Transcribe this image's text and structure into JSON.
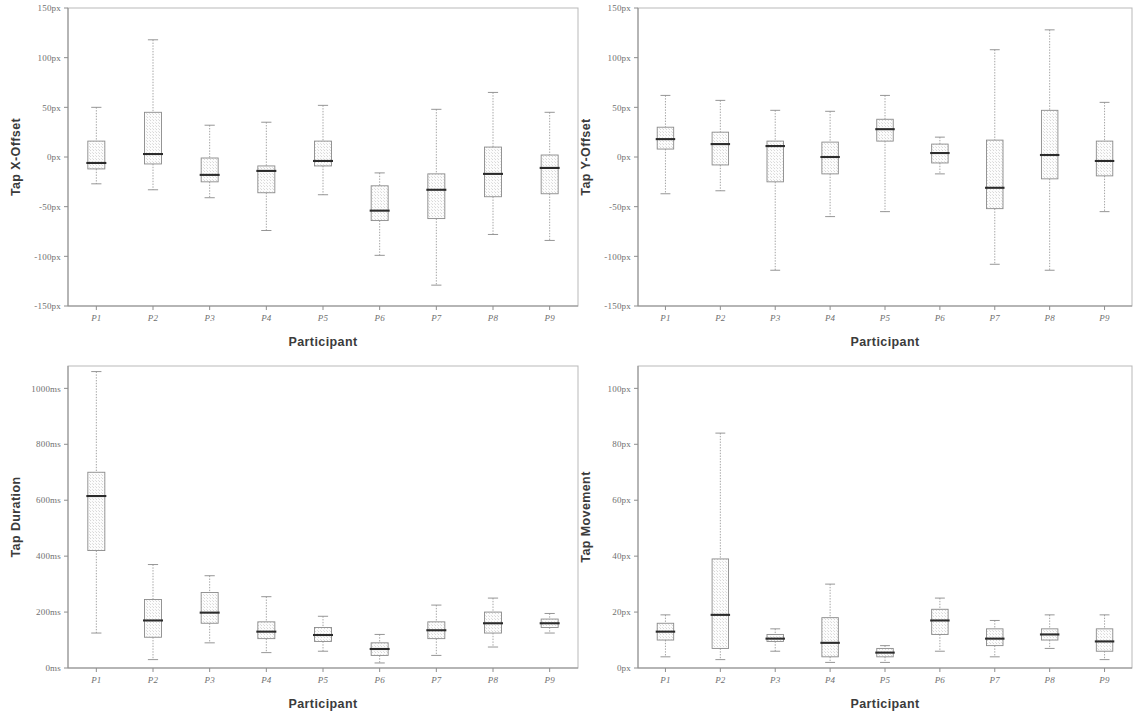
{
  "figure": {
    "participants": [
      "P1",
      "P2",
      "P3",
      "P4",
      "P5",
      "P6",
      "P7",
      "P8",
      "P9"
    ],
    "x_axis_title": "Participant",
    "colors": {
      "frame": "#b9b9b9",
      "axis": "#8e8e8e",
      "box_stroke": "#8a8a8a",
      "box_fill": "#fbfbfb",
      "median": "#2b2b2b",
      "whisker": "#9a9a9a",
      "tick_label": "#6f6f6f",
      "axis_title": "#3b3b3b"
    }
  },
  "chart_data": [
    {
      "id": "tap-x-offset",
      "position": "top-left",
      "type": "box",
      "title": "",
      "xlabel": "Participant",
      "ylabel": "Tap X-Offset",
      "ylim": [
        -150,
        150
      ],
      "unit": "px",
      "yticks": [
        150,
        100,
        50,
        0,
        -50,
        -100,
        -150
      ],
      "ytick_labels": [
        "150px",
        "100px",
        "50px",
        "0px",
        "-50px",
        "-100px",
        "-150px"
      ],
      "grid": false,
      "legend": "none",
      "categories": [
        "P1",
        "P2",
        "P3",
        "P4",
        "P5",
        "P6",
        "P7",
        "P8",
        "P9"
      ],
      "boxes": [
        {
          "category": "P1",
          "min": -27,
          "q1": -12,
          "median": -6,
          "q3": 16,
          "max": 50
        },
        {
          "category": "P2",
          "min": -33,
          "q1": -7,
          "median": 3,
          "q3": 45,
          "max": 118
        },
        {
          "category": "P3",
          "min": -41,
          "q1": -25,
          "median": -18,
          "q3": -1,
          "max": 32
        },
        {
          "category": "P4",
          "min": -74,
          "q1": -36,
          "median": -14,
          "q3": -9,
          "max": 35
        },
        {
          "category": "P5",
          "min": -38,
          "q1": -9,
          "median": -4,
          "q3": 16,
          "max": 52
        },
        {
          "category": "P6",
          "min": -99,
          "q1": -64,
          "median": -54,
          "q3": -29,
          "max": -16
        },
        {
          "category": "P7",
          "min": -129,
          "q1": -62,
          "median": -33,
          "q3": -17,
          "max": 48
        },
        {
          "category": "P8",
          "min": -78,
          "q1": -40,
          "median": -17,
          "q3": 10,
          "max": 65
        },
        {
          "category": "P9",
          "min": -84,
          "q1": -37,
          "median": -11,
          "q3": 2,
          "max": 45
        }
      ]
    },
    {
      "id": "tap-y-offset",
      "position": "top-right",
      "type": "box",
      "title": "",
      "xlabel": "Participant",
      "ylabel": "Tap Y-Offset",
      "ylim": [
        -150,
        150
      ],
      "unit": "px",
      "yticks": [
        150,
        100,
        50,
        0,
        -50,
        -100,
        -150
      ],
      "ytick_labels": [
        "150px",
        "100px",
        "50px",
        "0px",
        "-50px",
        "-100px",
        "-150px"
      ],
      "grid": false,
      "legend": "none",
      "categories": [
        "P1",
        "P2",
        "P3",
        "P4",
        "P5",
        "P6",
        "P7",
        "P8",
        "P9"
      ],
      "boxes": [
        {
          "category": "P1",
          "min": -37,
          "q1": 8,
          "median": 18,
          "q3": 30,
          "max": 62
        },
        {
          "category": "P2",
          "min": -34,
          "q1": -8,
          "median": 13,
          "q3": 25,
          "max": 57
        },
        {
          "category": "P3",
          "min": -114,
          "q1": -25,
          "median": 11,
          "q3": 16,
          "max": 47
        },
        {
          "category": "P4",
          "min": -60,
          "q1": -17,
          "median": 0,
          "q3": 15,
          "max": 46
        },
        {
          "category": "P5",
          "min": -55,
          "q1": 16,
          "median": 28,
          "q3": 38,
          "max": 62
        },
        {
          "category": "P6",
          "min": -17,
          "q1": -6,
          "median": 4,
          "q3": 13,
          "max": 20
        },
        {
          "category": "P7",
          "min": -108,
          "q1": -52,
          "median": -31,
          "q3": 17,
          "max": 108
        },
        {
          "category": "P8",
          "min": -114,
          "q1": -22,
          "median": 2,
          "q3": 47,
          "max": 128
        },
        {
          "category": "P9",
          "min": -55,
          "q1": -19,
          "median": -4,
          "q3": 16,
          "max": 55
        }
      ]
    },
    {
      "id": "tap-duration",
      "position": "bottom-left",
      "type": "box",
      "title": "",
      "xlabel": "Participant",
      "ylabel": "Tap Duration",
      "ylim": [
        0,
        1080
      ],
      "unit": "ms",
      "yticks": [
        1000,
        800,
        600,
        400,
        200,
        0
      ],
      "ytick_labels": [
        "1000ms",
        "800ms",
        "600ms",
        "400ms",
        "200ms",
        "0ms"
      ],
      "grid": false,
      "legend": "none",
      "categories": [
        "P1",
        "P2",
        "P3",
        "P4",
        "P5",
        "P6",
        "P7",
        "P8",
        "P9"
      ],
      "boxes": [
        {
          "category": "P1",
          "min": 125,
          "q1": 420,
          "median": 615,
          "q3": 700,
          "max": 1060
        },
        {
          "category": "P2",
          "min": 30,
          "q1": 110,
          "median": 170,
          "q3": 245,
          "max": 370
        },
        {
          "category": "P3",
          "min": 90,
          "q1": 160,
          "median": 198,
          "q3": 270,
          "max": 330
        },
        {
          "category": "P4",
          "min": 55,
          "q1": 105,
          "median": 130,
          "q3": 165,
          "max": 255
        },
        {
          "category": "P5",
          "min": 60,
          "q1": 95,
          "median": 118,
          "q3": 145,
          "max": 185
        },
        {
          "category": "P6",
          "min": 18,
          "q1": 45,
          "median": 68,
          "q3": 90,
          "max": 120
        },
        {
          "category": "P7",
          "min": 45,
          "q1": 105,
          "median": 135,
          "q3": 165,
          "max": 225
        },
        {
          "category": "P8",
          "min": 75,
          "q1": 125,
          "median": 160,
          "q3": 200,
          "max": 250
        },
        {
          "category": "P9",
          "min": 125,
          "q1": 145,
          "median": 160,
          "q3": 175,
          "max": 195
        }
      ]
    },
    {
      "id": "tap-movement",
      "position": "bottom-right",
      "type": "box",
      "title": "",
      "xlabel": "Participant",
      "ylabel": "Tap Movement",
      "ylim": [
        0,
        108
      ],
      "unit": "px",
      "yticks": [
        100,
        80,
        60,
        40,
        20,
        0
      ],
      "ytick_labels": [
        "100px",
        "80px",
        "60px",
        "40px",
        "20px",
        "0px"
      ],
      "grid": false,
      "legend": "none",
      "categories": [
        "P1",
        "P2",
        "P3",
        "P4",
        "P5",
        "P6",
        "P7",
        "P8",
        "P9"
      ],
      "boxes": [
        {
          "category": "P1",
          "min": 4,
          "q1": 10,
          "median": 13,
          "q3": 16,
          "max": 19
        },
        {
          "category": "P2",
          "min": 3,
          "q1": 7,
          "median": 19,
          "q3": 39,
          "max": 84
        },
        {
          "category": "P3",
          "min": 6,
          "q1": 9.5,
          "median": 10.5,
          "q3": 12,
          "max": 14
        },
        {
          "category": "P4",
          "min": 2,
          "q1": 4,
          "median": 9,
          "q3": 18,
          "max": 30
        },
        {
          "category": "P5",
          "min": 2,
          "q1": 4,
          "median": 5.5,
          "q3": 7,
          "max": 8
        },
        {
          "category": "P6",
          "min": 6,
          "q1": 12,
          "median": 17,
          "q3": 21,
          "max": 25
        },
        {
          "category": "P7",
          "min": 4,
          "q1": 8,
          "median": 10.5,
          "q3": 14,
          "max": 17
        },
        {
          "category": "P8",
          "min": 7,
          "q1": 10,
          "median": 12,
          "q3": 14,
          "max": 19
        },
        {
          "category": "P9",
          "min": 3,
          "q1": 6,
          "median": 9.5,
          "q3": 14,
          "max": 19
        }
      ]
    }
  ]
}
